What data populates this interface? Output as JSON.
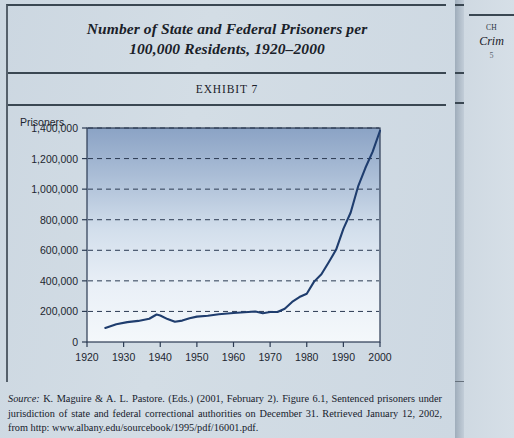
{
  "figure": {
    "title": "Number of State and Federal Prisoners per 100,000 Residents, 1920–2000",
    "title_line_1": "Number of State and Federal Prisoners per",
    "title_line_2": "100,000 Residents, 1920–2000",
    "exhibit_label": "EXHIBIT 7"
  },
  "source": {
    "label": "Source:",
    "text": " K. Maguire & A. L. Pastore. (Eds.) (2001, February 2). Figure 6.1, Sentenced prisoners under jurisdiction of state and federal correctional authorities on December 31. Retrieved January 12, 2002, from http: www.albany.edu/sourcebook/1995/pdf/16001.pdf."
  },
  "adjacent_page": {
    "line_1": "CH",
    "line_2": "Crim",
    "line_3": "5"
  },
  "colors": {
    "page_background": "#cfd9e2",
    "rule": "#3a4752",
    "line_series": "#1f3d6e",
    "plot_gradient_top": "#8aa2c4",
    "plot_gradient_bottom": "#f2f6fa",
    "text": "#1a2129"
  },
  "chart_data": {
    "type": "line",
    "title": "Number of State and Federal Prisoners per 100,000 Residents, 1920–2000",
    "xlabel": "",
    "ylabel": "Prisoners",
    "grid": true,
    "legend": "none",
    "xlim": [
      1920,
      2000
    ],
    "ylim": [
      0,
      1400000
    ],
    "xticks": [
      1920,
      1930,
      1940,
      1950,
      1960,
      1970,
      1980,
      1990,
      2000
    ],
    "xtick_labels": [
      "1920",
      "1930",
      "1940",
      "1950",
      "1960",
      "1970",
      "1980",
      "1990",
      "2000"
    ],
    "yticks": [
      0,
      200000,
      400000,
      600000,
      800000,
      1000000,
      1200000,
      1400000
    ],
    "ytick_labels": [
      "0",
      "200,000",
      "400,000",
      "600,000",
      "800,000",
      "1,000,000",
      "1,200,000",
      "1,400,000"
    ],
    "series": [
      {
        "name": "Sentenced prisoners",
        "x": [
          1925,
          1928,
          1931,
          1934,
          1937,
          1939,
          1940,
          1942,
          1944,
          1946,
          1948,
          1950,
          1953,
          1956,
          1960,
          1963,
          1966,
          1968,
          1970,
          1972,
          1974,
          1976,
          1978,
          1980,
          1982,
          1984,
          1986,
          1988,
          1990,
          1992,
          1994,
          1996,
          1998,
          2000
        ],
        "values": [
          91669,
          116390,
          130000,
          138000,
          152000,
          180000,
          173706,
          150000,
          132000,
          140000,
          155000,
          166123,
          172000,
          182000,
          189735,
          195000,
          199654,
          188000,
          196429,
          196000,
          218000,
          262000,
          294000,
          315974,
          395000,
          443000,
          522000,
          603000,
          739980,
          847000,
          1016000,
          1138000,
          1245000,
          1381892
        ]
      }
    ]
  }
}
